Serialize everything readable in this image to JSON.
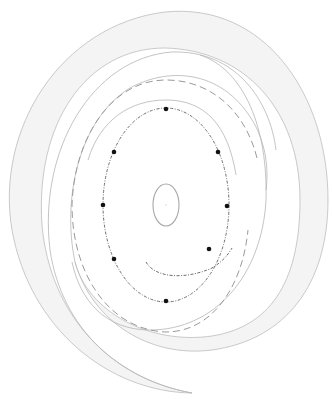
{
  "diagram": {
    "type": "spiral-disk-with-orbit-markers",
    "colors": {
      "background": "#ffffff",
      "band_fill": "#f4f4f4",
      "band_stroke": "#bdbdbd",
      "dashed_orbit": "#9a9a9a",
      "inner_orbit": "#6e6e6e",
      "core": "#a8a8a8",
      "marker": "#111111"
    },
    "core_ellipse": {
      "cx": 166,
      "cy": 205,
      "rx": 13,
      "ry": 21
    },
    "inner_orbit": {
      "cx": 166,
      "cy": 205,
      "rx": 63,
      "ry": 97
    },
    "markers": [
      {
        "x": 166,
        "y": 109
      },
      {
        "x": 114,
        "y": 152
      },
      {
        "x": 218,
        "y": 152
      },
      {
        "x": 103,
        "y": 205
      },
      {
        "x": 227,
        "y": 206
      },
      {
        "x": 114,
        "y": 259
      },
      {
        "x": 209,
        "y": 249
      },
      {
        "x": 166,
        "y": 301
      }
    ],
    "marker_count": 8
  }
}
